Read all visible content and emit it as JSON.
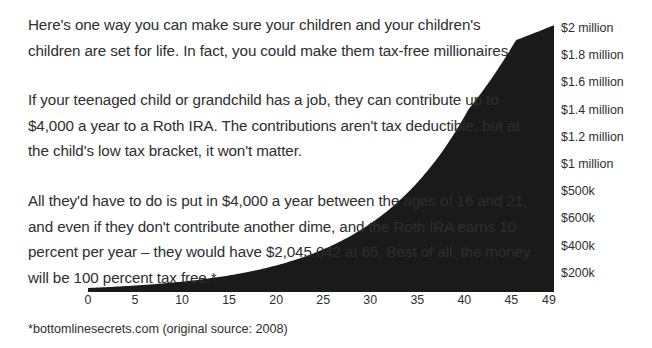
{
  "figure": {
    "background_color": "#ffffff",
    "text_color": "#2e2e2e",
    "curve_fill_color": "#1a1a1a"
  },
  "prose": {
    "paragraph_1": "Here's one way you can make sure your children and your children's children are set for life. In fact, you could make them tax-free millionaires.",
    "paragraph_2": "If your teenaged child or grandchild has a job, they can contribute up to $4,000 a year to a Roth IRA. The contributions aren't tax deductible, but at the child's low tax bracket, it won't matter.",
    "paragraph_3": "All they'd have to do is put in $4,000 a year between the ages of 16 and 21, and even if they don't contribute another dime, and the Roth IRA earns 10 percent per year – they would have $2,045,042 at 65. Best of all, the money will be 100 percent tax free.*"
  },
  "footnote": {
    "text": "*bottomlinesecrets.com (original source: 2008)"
  },
  "chart_data": {
    "type": "area",
    "title": "",
    "xlabel": "",
    "ylabel": "",
    "grid": false,
    "legend": false,
    "x": [
      0,
      5,
      10,
      15,
      20,
      25,
      30,
      35,
      40,
      45,
      49
    ],
    "xtick_labels": [
      "0",
      "5",
      "10",
      "15",
      "20",
      "25",
      "30",
      "35",
      "40",
      "45",
      "49"
    ],
    "xlim": [
      0,
      49
    ],
    "ytick_labels": [
      "$2 million",
      "$1.8 million",
      "$1.6 million",
      "$1.4 million",
      "$1.2 million",
      "$1 million",
      "$500k",
      "$600k",
      "$400k",
      "$200k"
    ],
    "ytick_values": [
      2000000,
      1800000,
      1600000,
      1400000,
      1200000,
      1000000,
      800000,
      600000,
      400000,
      200000
    ],
    "ylim": [
      0,
      2100000
    ],
    "series": [
      {
        "name": "Roth IRA balance",
        "values": [
          31000,
          50000,
          80000,
          129000,
          208000,
          335000,
          540000,
          869000,
          1399000,
          1930000,
          2045042
        ]
      }
    ],
    "annotations": {
      "final_value_label": "$2,045,042 at 65",
      "growth_rate": "10 percent per year",
      "annual_contribution": "$4,000",
      "contribution_ages": "16 and 21"
    }
  }
}
